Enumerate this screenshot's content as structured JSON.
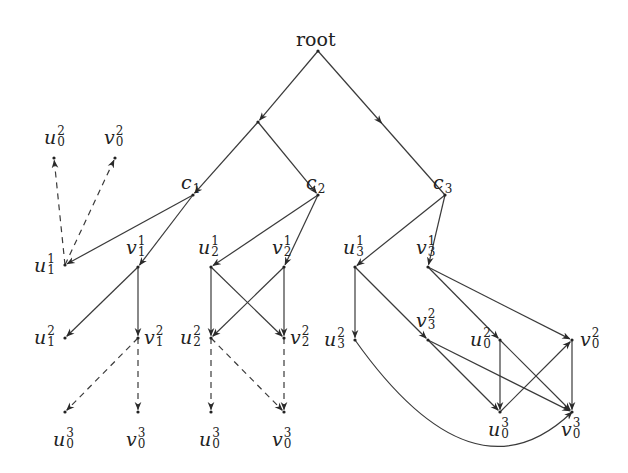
{
  "diagram": {
    "title": "",
    "colors": {
      "edge": "#3a3a3a",
      "text": "#222222",
      "background": "#ffffff"
    },
    "nodes": [
      {
        "id": "root",
        "label": "root",
        "base": "root",
        "sup": "",
        "sub": "",
        "x": 318,
        "y": 51,
        "lx": 296,
        "ly": 30,
        "upright": true
      },
      {
        "id": "mid_left",
        "label": "",
        "x": 258,
        "y": 122
      },
      {
        "id": "c1",
        "label": "c1",
        "base": "c",
        "sup": "",
        "sub": "1",
        "x": 193,
        "y": 195,
        "lx": 181,
        "ly": 173
      },
      {
        "id": "c2",
        "label": "c2",
        "base": "c",
        "sup": "",
        "sub": "2",
        "x": 318,
        "y": 195,
        "lx": 306,
        "ly": 173
      },
      {
        "id": "c3",
        "label": "c3",
        "base": "c",
        "sup": "",
        "sub": "3",
        "x": 445,
        "y": 195,
        "lx": 433,
        "ly": 173
      },
      {
        "id": "u02_top",
        "label": "u_0^2",
        "base": "u",
        "sup": "2",
        "sub": "0",
        "x": 54,
        "y": 158,
        "lx": 44,
        "ly": 128
      },
      {
        "id": "v02_top",
        "label": "v_0^2",
        "base": "v",
        "sup": "2",
        "sub": "0",
        "x": 115,
        "y": 158,
        "lx": 104,
        "ly": 128
      },
      {
        "id": "u11",
        "label": "u_1^1",
        "base": "u",
        "sup": "1",
        "sub": "1",
        "x": 65,
        "y": 265,
        "lx": 34,
        "ly": 256
      },
      {
        "id": "v11",
        "label": "v_1^1",
        "base": "v",
        "sup": "1",
        "sub": "1",
        "x": 138,
        "y": 267,
        "lx": 126,
        "ly": 238
      },
      {
        "id": "u21",
        "label": "u_2^1",
        "base": "u",
        "sup": "1",
        "sub": "2",
        "x": 211,
        "y": 267,
        "lx": 198,
        "ly": 238
      },
      {
        "id": "v21",
        "label": "v_2^1",
        "base": "v",
        "sup": "1",
        "sub": "2",
        "x": 284,
        "y": 267,
        "lx": 272,
        "ly": 238
      },
      {
        "id": "u31",
        "label": "u_3^1",
        "base": "u",
        "sup": "1",
        "sub": "3",
        "x": 355,
        "y": 267,
        "lx": 343,
        "ly": 238
      },
      {
        "id": "v31",
        "label": "v_3^1",
        "base": "v",
        "sup": "1",
        "sub": "3",
        "x": 428,
        "y": 267,
        "lx": 416,
        "ly": 238
      },
      {
        "id": "u12",
        "label": "u_1^2",
        "base": "u",
        "sup": "2",
        "sub": "1",
        "x": 65,
        "y": 338,
        "lx": 34,
        "ly": 328
      },
      {
        "id": "v12",
        "label": "v_1^2",
        "base": "v",
        "sup": "2",
        "sub": "1",
        "x": 138,
        "y": 338,
        "lx": 144,
        "ly": 328
      },
      {
        "id": "u22",
        "label": "u_2^2",
        "base": "u",
        "sup": "2",
        "sub": "2",
        "x": 211,
        "y": 338,
        "lx": 180,
        "ly": 328
      },
      {
        "id": "v22",
        "label": "v_2^2",
        "base": "v",
        "sup": "2",
        "sub": "2",
        "x": 284,
        "y": 338,
        "lx": 290,
        "ly": 328
      },
      {
        "id": "u32",
        "label": "u_3^2",
        "base": "u",
        "sup": "2",
        "sub": "3",
        "x": 355,
        "y": 340,
        "lx": 324,
        "ly": 330
      },
      {
        "id": "v32",
        "label": "v_3^2",
        "base": "v",
        "sup": "2",
        "sub": "3",
        "x": 428,
        "y": 340,
        "lx": 416,
        "ly": 311
      },
      {
        "id": "u02_r",
        "label": "u_0^2",
        "base": "u",
        "sup": "2",
        "sub": "0",
        "x": 500,
        "y": 340,
        "lx": 470,
        "ly": 330
      },
      {
        "id": "v02_r",
        "label": "v_0^2",
        "base": "v",
        "sup": "2",
        "sub": "0",
        "x": 572,
        "y": 340,
        "lx": 580,
        "ly": 330
      },
      {
        "id": "u03_r",
        "label": "u_0^3",
        "base": "u",
        "sup": "3",
        "sub": "0",
        "x": 500,
        "y": 412,
        "lx": 488,
        "ly": 420
      },
      {
        "id": "v03_r",
        "label": "v_0^3",
        "base": "v",
        "sup": "3",
        "sub": "0",
        "x": 572,
        "y": 412,
        "lx": 561,
        "ly": 420
      },
      {
        "id": "u03_a",
        "label": "u_0^3",
        "base": "u",
        "sup": "3",
        "sub": "0",
        "x": 65,
        "y": 412,
        "lx": 53,
        "ly": 430
      },
      {
        "id": "v03_a",
        "label": "v_0^3",
        "base": "v",
        "sup": "3",
        "sub": "0",
        "x": 138,
        "y": 412,
        "lx": 126,
        "ly": 430
      },
      {
        "id": "u03_b",
        "label": "u_0^3",
        "base": "u",
        "sup": "3",
        "sub": "0",
        "x": 211,
        "y": 412,
        "lx": 199,
        "ly": 430
      },
      {
        "id": "v03_b",
        "label": "v_0^3",
        "base": "v",
        "sup": "3",
        "sub": "0",
        "x": 284,
        "y": 412,
        "lx": 272,
        "ly": 430
      }
    ],
    "edges": [
      {
        "from": "root",
        "to": "mid_left",
        "style": "solid"
      },
      {
        "from": "root",
        "to": "c3",
        "style": "solid",
        "mid_arrow": true
      },
      {
        "from": "mid_left",
        "to": "c1",
        "style": "solid"
      },
      {
        "from": "mid_left",
        "to": "c2",
        "style": "solid"
      },
      {
        "from": "c1",
        "to": "u11",
        "style": "solid"
      },
      {
        "from": "c1",
        "to": "v11",
        "style": "solid"
      },
      {
        "from": "c2",
        "to": "u21",
        "style": "solid"
      },
      {
        "from": "c2",
        "to": "v21",
        "style": "solid"
      },
      {
        "from": "c3",
        "to": "u31",
        "style": "solid"
      },
      {
        "from": "c3",
        "to": "v31",
        "style": "solid"
      },
      {
        "from": "u11",
        "to": "u02_top",
        "style": "dashed"
      },
      {
        "from": "u11",
        "to": "v02_top",
        "style": "dashed"
      },
      {
        "from": "v11",
        "to": "u12",
        "style": "solid"
      },
      {
        "from": "v11",
        "to": "v12",
        "style": "solid"
      },
      {
        "from": "v12",
        "to": "u03_a",
        "style": "dashed"
      },
      {
        "from": "v12",
        "to": "v03_a",
        "style": "dashed"
      },
      {
        "from": "u21",
        "to": "u22",
        "style": "solid"
      },
      {
        "from": "u21",
        "to": "v22",
        "style": "solid"
      },
      {
        "from": "v21",
        "to": "u22",
        "style": "solid"
      },
      {
        "from": "v21",
        "to": "v22",
        "style": "solid"
      },
      {
        "from": "u22",
        "to": "u03_b",
        "style": "dashed"
      },
      {
        "from": "u22",
        "to": "v03_b",
        "style": "dashed"
      },
      {
        "from": "v22",
        "to": "v03_b",
        "style": "dashed"
      },
      {
        "from": "u31",
        "to": "u32",
        "style": "solid"
      },
      {
        "from": "u31",
        "to": "v32",
        "style": "solid"
      },
      {
        "from": "v31",
        "to": "u02_r",
        "style": "solid"
      },
      {
        "from": "v31",
        "to": "v02_r",
        "style": "solid"
      },
      {
        "from": "v32",
        "to": "u03_r",
        "style": "solid"
      },
      {
        "from": "v32",
        "to": "v03_r",
        "style": "solid"
      },
      {
        "from": "u02_r",
        "to": "u03_r",
        "style": "solid"
      },
      {
        "from": "u02_r",
        "to": "v03_r",
        "style": "solid"
      },
      {
        "from": "u03_r",
        "to": "v02_r",
        "style": "solid"
      },
      {
        "from": "v02_r",
        "to": "v03_r",
        "style": "solid"
      },
      {
        "from": "u32",
        "to": "v03_r",
        "style": "solid",
        "curve": true
      }
    ]
  }
}
